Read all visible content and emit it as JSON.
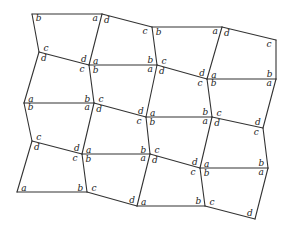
{
  "diagram": {
    "line_color": "#333333",
    "label_color": "#222222",
    "vertices": [
      [
        [
          32,
          14
        ],
        [
          102,
          14
        ],
        [
          152,
          27
        ],
        [
          222,
          27
        ],
        [
          276,
          40
        ]
      ],
      [
        [
          39,
          52
        ],
        [
          89,
          65
        ],
        [
          157,
          65
        ],
        [
          207,
          79
        ],
        [
          276,
          79
        ]
      ],
      [
        [
          24,
          103
        ],
        [
          94,
          103
        ],
        [
          146,
          117
        ],
        [
          212,
          117
        ],
        [
          263,
          128
        ]
      ],
      [
        [
          32,
          141
        ],
        [
          82,
          154
        ],
        [
          150,
          154
        ],
        [
          200,
          168
        ],
        [
          268,
          168
        ]
      ],
      [
        [
          17,
          192
        ],
        [
          87,
          192
        ],
        [
          137,
          206
        ],
        [
          205,
          206
        ],
        [
          255,
          219
        ]
      ]
    ],
    "quads": [
      [
        {
          "tl": "b",
          "tr": "a",
          "br": "d",
          "bl": "c"
        },
        {
          "tl": "d",
          "tr": "c",
          "br": "b",
          "bl": "a"
        },
        {
          "tl": "b",
          "tr": "a",
          "br": "d",
          "bl": "c"
        },
        {
          "tl": "d",
          "tr": "c",
          "br": "b",
          "bl": "a"
        }
      ],
      [
        {
          "tl": "d",
          "tr": "c",
          "br": "b",
          "bl": "a"
        },
        {
          "tl": "b",
          "tr": "a",
          "br": "d",
          "bl": "c"
        },
        {
          "tl": "d",
          "tr": "c",
          "br": "b",
          "bl": "a"
        },
        {
          "tl": "b",
          "tr": "a",
          "br": "d",
          "bl": "c"
        }
      ],
      [
        {
          "tl": "b",
          "tr": "a",
          "br": "d",
          "bl": "c"
        },
        {
          "tl": "d",
          "tr": "c",
          "br": "b",
          "bl": "a"
        },
        {
          "tl": "b",
          "tr": "a",
          "br": "d",
          "bl": "c"
        },
        {
          "tl": "d",
          "tr": "c",
          "br": "b",
          "bl": "a"
        }
      ],
      [
        {
          "tl": "d",
          "tr": "c",
          "br": "b",
          "bl": "a"
        },
        {
          "tl": "b",
          "tr": "a",
          "br": "d",
          "bl": "c"
        },
        {
          "tl": "d",
          "tr": "c",
          "br": "b",
          "bl": "a"
        },
        {
          "tl": "b",
          "tr": "a",
          "br": "d",
          "bl": "c"
        }
      ]
    ]
  }
}
